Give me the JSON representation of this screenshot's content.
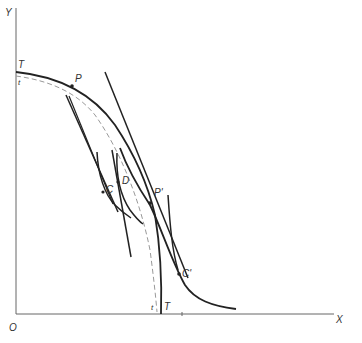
{
  "diagram": {
    "axes": {
      "x_label": "X",
      "y_label": "Y",
      "origin_label": "O"
    },
    "points": {
      "T_top": "T",
      "t_top": "t",
      "P": "P",
      "C": "C",
      "D": "D",
      "P_prime": "P'",
      "C_prime": "C'",
      "t_bottom": "t",
      "T_bottom": "T"
    },
    "colors": {
      "solid": "#222222",
      "dashed": "#999999",
      "axis": "#666666"
    }
  }
}
